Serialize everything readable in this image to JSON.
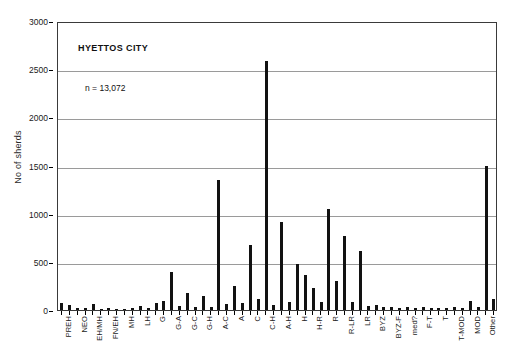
{
  "chart_data": {
    "type": "bar",
    "title": "HYETTOS CITY",
    "annotation": "n = 13,072",
    "xlabel": "",
    "ylabel": "No of sherds",
    "ylim": [
      0,
      3000
    ],
    "ytick_values": [
      0,
      500,
      1000,
      1500,
      2000,
      2500,
      3000
    ],
    "ytick_labels": [
      "0",
      "500",
      "1000",
      "1500",
      "2000",
      "2500",
      "3000"
    ],
    "grid": "horizontal",
    "legend": "none",
    "bar_color": "#121212",
    "categories": [
      "PREH",
      "",
      "NEO",
      "",
      "EH/MH",
      "",
      "FN/EH",
      "",
      "MH",
      "",
      "LH",
      "",
      "G",
      "",
      "G-A",
      "",
      "G-C",
      "",
      "G-H",
      "",
      "A-C",
      "",
      "A",
      "",
      "C",
      "",
      "C-H",
      "",
      "A-H",
      "",
      "H",
      "",
      "H-R",
      "",
      "R",
      "",
      "R-LR",
      "",
      "LR",
      "",
      "BYZ",
      "",
      "BYZ-F",
      "",
      "med?",
      "",
      "F-T",
      "",
      "T",
      "",
      "T-MOD",
      "",
      "MOD",
      "",
      "Other",
      ""
    ],
    "values": [
      70,
      55,
      25,
      18,
      60,
      12,
      20,
      10,
      15,
      22,
      40,
      18,
      75,
      95,
      390,
      40,
      180,
      30,
      150,
      35,
      1345,
      60,
      250,
      70,
      680,
      110,
      2580,
      55,
      915,
      85,
      480,
      360,
      230,
      85,
      1050,
      300,
      770,
      80,
      610,
      45,
      50,
      28,
      30,
      25,
      28,
      22,
      30,
      26,
      25,
      20,
      30,
      18,
      90,
      35,
      1500,
      115
    ],
    "labeled_categories": [
      "PREH",
      "NEO",
      "EH/MH",
      "FN/EH",
      "MH",
      "LH",
      "G",
      "G-A",
      "G-C",
      "G-H",
      "A-C",
      "A",
      "C",
      "C-H",
      "A-H",
      "H",
      "H-R",
      "R",
      "R-LR",
      "LR",
      "BYZ",
      "BYZ-F",
      "med?",
      "F-T",
      "T",
      "T-MOD",
      "MOD",
      "Other"
    ]
  }
}
